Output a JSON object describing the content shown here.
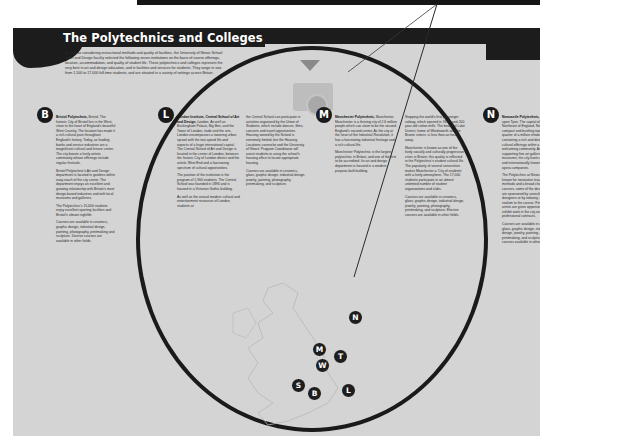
{
  "page": {
    "title": "The Polytechnics and Colleges",
    "intro": "As well as considering instructional methods and quality of facilities, the University of Illinois School of Art and Design faculty selected the following seven institutions on the basis of course offerings, location, accommodation, and quality of student life. These polytechnics and colleges represent the very best in art and design education, and in facilities and services for students. They range in size from 1,500 to 17,000 full-time students, and are situated in a variety of settings across Britain."
  },
  "colors": {
    "page_bg": "#d4d4d4",
    "header_bg": "#1c1c1c",
    "badge_bg": "#1a1a1a",
    "circle_stroke": "#1a1a1a"
  },
  "sections": [
    {
      "badge": "B",
      "heading": "Bristol Polytechnic,",
      "paragraphs": [
        "Bristol. The historic City of Bristol lies in the West, close to the heart of England's beautiful West Country. The location has made it a rich cultural past throughout England's history. Today, as leading banks and service industries are a magnificent cultural and leisure center. The city boasts a lively artistic community whose offerings include regular festivals.",
        "Bristol Polytechnic's Art and Design department is located in gardens within easy reach of the city center. The department enjoys an excellent and growing relationship with Britain's most design-based industries and with local museums and galleries.",
        "The Polytechnic's 15,000 students enjoy excellent sporting facilities and Bristol's vibrant nightlife.",
        "Courses are available in ceramics, graphic design, industrial design, painting, photography, printmaking and sculpture. Diverse courses are available in other fields."
      ]
    },
    {
      "badge": "L",
      "heading": "London Institute, Central School of Art and Design,",
      "paragraphs": [
        "London. As well as Buckingham Palace, Big Ben, and the Tower of London, trade and the arts, London encompasses a towering urban sprawl with the two-speed life and aspects of a huge international capital. The Central School of Art and Design is located in the center of London, between the historic City of London district and the artistic West End and a fascinating spectrum of cultural opportunities.",
        "The position of the institution is the program of 1,900 students. The Central School was founded in 1896 and is housed in a Victorian Gothic building.",
        "As well as the annual modern cultural and entertainment resources of London, students at"
      ]
    },
    {
      "badge": "",
      "heading": "",
      "paragraphs": [
        "the Central School can participate in activities organized by the Union of Students, which include dances, films, concerts and travel opportunities. Housing owned by the School is extremely limited, but the Housing Locations counselor and the University of Illinois' Program Coordinator will assist students in using the school's housing office to locate appropriate housing.",
        "Courses are available in ceramics, glass, graphic design, industrial design, jewelry, painting, photography, printmaking, and sculpture."
      ]
    },
    {
      "badge": "M",
      "heading": "Manchester Polytechnic,",
      "paragraphs": [
        "Manchester. Manchester is a thriving city of 2.6 million people which can claim to be the second England's second center. As the city at the heart of the Industrial Revolution, it has a fascinating industrial heritage and a rich cultural life.",
        "Manchester Polytechnic is the largest polytechnic in Britain, and one of the first to be accredited. Its art and design department is housed in a modern purpose-built building.",
        "Manchester is known as one of the most socially and culturally progressive cities in Britain; this quality is reflected in the Polytechnic's diverse student population."
      ]
    },
    {
      "badge": "",
      "heading": "",
      "paragraphs": [
        "Stopping the world's first passenger railway, which opened in 1830, and 200 year-old cotton mills. The beautiful Lake District, home of Wordsworth and the Bronte sisters, is less than an hour away.",
        "Manchester is known as one of the lively socially and culturally progressive cities in Britain; this quality is reflected in the Polytechnic's student cultural life. The popularity of several universities makes Manchester a 'City of students' with a lively atmosphere. The 17,000 students participate in an almost unlimited number of student organizations and clubs.",
        "Courses are available in ceramics, glass, graphic design, industrial design, jewelry, painting, photography, printmaking, and sculpture. Elective courses are available in other fields."
      ]
    },
    {
      "badge": "N",
      "heading": "Newcastle Polytechnic,",
      "paragraphs": [
        "Newcastle upon Tyne. The capital of the Northeast of England, Newcastle is a compact and bustling town of a quarter of a million inhabitants, containing a rich and diverse range of cultural offerings within a friendly and welcoming community. As well as supporting fine art galleries and two museums, the city hosts nationally and internationally known theatre and opera companies.",
        "The Polytechnic at Newcastle is known for innovative teaching methods and a broad choice of courses, some of the design projects are sponsored by consultant designers or by industry, to add realism to the course. Fine and studio artists are given opportunities to exhibit work in the city and to hold professional contracts.",
        "Courses are available in ceramics, glass, graphic design, industrial design, jewelry, painting, photography, printmaking, and sculpture. Elective courses available in other fields."
      ]
    }
  ],
  "map": {
    "markers": [
      "N",
      "M",
      "T",
      "W",
      "S",
      "B",
      "L"
    ]
  }
}
